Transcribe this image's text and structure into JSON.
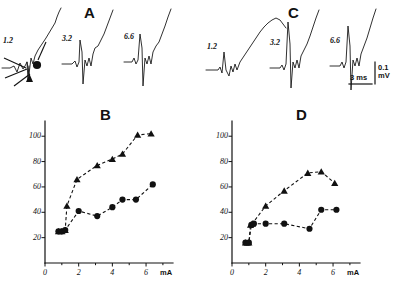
{
  "figure": {
    "panels": [
      {
        "id": "A",
        "label": "A",
        "label_x": 84,
        "label_y": 8
      },
      {
        "id": "B",
        "label": "B",
        "label_x": 88,
        "label_y": 108
      },
      {
        "id": "C",
        "label": "C",
        "label_x": 288,
        "label_y": 8
      },
      {
        "id": "D",
        "label": "D",
        "label_x": 288,
        "label_y": 108
      }
    ]
  },
  "traces": {
    "panel_a": [
      {
        "label": "1.2",
        "label_x": 7,
        "label_y": 40
      },
      {
        "label": "3.2",
        "label_x": 65,
        "label_y": 38
      },
      {
        "label": "6.6",
        "label_x": 127,
        "label_y": 36
      }
    ],
    "panel_c": [
      {
        "label": "1.2",
        "label_x": 210,
        "label_y": 40
      },
      {
        "label": "3.2",
        "label_x": 272,
        "label_y": 38
      },
      {
        "label": "6.6",
        "label_x": 330,
        "label_y": 36
      }
    ],
    "markers": {
      "circle_name": "filled-circle-marker",
      "triangle_name": "filled-triangle-marker"
    }
  },
  "scale_bar": {
    "amplitude_value": "0.1",
    "amplitude_unit": "mV",
    "time_value": "3",
    "time_unit": "ms",
    "amp_x": 379,
    "amp_y": 70,
    "time_x": 352,
    "time_y": 88
  },
  "chart_data": [
    {
      "type": "line",
      "panel": "B",
      "title": "B",
      "xlabel": "mA",
      "ylabel": "",
      "xlim": [
        0,
        7.6
      ],
      "ylim": [
        0,
        112
      ],
      "xticks": [
        0,
        2,
        4,
        6
      ],
      "xticklabels": [
        "0",
        "2",
        "4",
        "6"
      ],
      "yticks": [
        20,
        40,
        60,
        80,
        100
      ],
      "yticklabels": [
        "20",
        "40",
        "60",
        "80",
        "100"
      ],
      "grid": false,
      "legend": "none",
      "series": [
        {
          "name": "triangle-series",
          "marker": "triangle",
          "linestyle": "dashed",
          "x": [
            0.8,
            1.0,
            1.2,
            1.3,
            1.9,
            3.1,
            4.0,
            4.6,
            5.5,
            6.3
          ],
          "y": [
            25,
            25,
            26,
            45,
            66,
            77,
            82,
            86,
            101,
            102
          ]
        },
        {
          "name": "circle-series",
          "marker": "circle",
          "linestyle": "dashed",
          "x": [
            0.8,
            1.0,
            1.2,
            2.0,
            3.1,
            4.0,
            4.6,
            5.4,
            6.4
          ],
          "y": [
            25,
            25,
            26,
            41,
            37,
            44,
            50,
            50,
            62
          ]
        }
      ]
    },
    {
      "type": "line",
      "panel": "D",
      "title": "D",
      "xlabel": "mA",
      "ylabel": "",
      "xlim": [
        0,
        7.6
      ],
      "ylim": [
        0,
        112
      ],
      "xticks": [
        0,
        2,
        4,
        6
      ],
      "xticklabels": [
        "0",
        "2",
        "4",
        "6"
      ],
      "yticks": [
        20,
        40,
        60,
        80,
        100
      ],
      "yticklabels": [
        "20",
        "40",
        "60",
        "80",
        "100"
      ],
      "grid": false,
      "legend": "none",
      "series": [
        {
          "name": "triangle-series",
          "marker": "triangle",
          "linestyle": "dashed",
          "x": [
            0.8,
            1.0,
            1.1,
            1.2,
            2.0,
            3.1,
            4.5,
            5.3,
            6.1
          ],
          "y": [
            16,
            16,
            30,
            31,
            45,
            57,
            71,
            72,
            63
          ]
        },
        {
          "name": "circle-series",
          "marker": "circle",
          "linestyle": "dashed",
          "x": [
            0.8,
            1.0,
            1.15,
            1.3,
            2.0,
            3.1,
            4.6,
            5.3,
            6.2
          ],
          "y": [
            16,
            16,
            30,
            31,
            31,
            31,
            27,
            42,
            42
          ]
        }
      ]
    }
  ]
}
